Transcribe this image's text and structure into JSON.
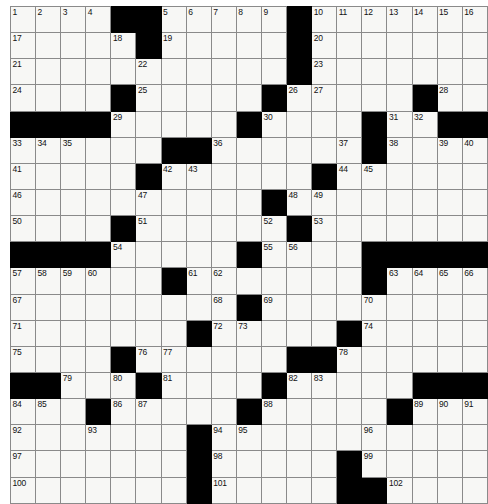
{
  "puzzle": {
    "title": "Crossword Grid",
    "type": "crossword",
    "rows": 19,
    "cols": 19,
    "cell_fill_color": "#f7f7f5",
    "block_color": "#000000",
    "grid_line_color": "#8a8a8a",
    "max_clue_number": 102,
    "grid": [
      [
        {
          "n": "1"
        },
        {
          "n": "2"
        },
        {
          "n": "3"
        },
        {
          "n": "4"
        },
        {
          "b": 1
        },
        {
          "b": 1
        },
        {
          "n": "5"
        },
        {
          "n": "6"
        },
        {
          "n": "7"
        },
        {
          "n": "8"
        },
        {
          "n": "9"
        },
        {
          "b": 1
        },
        {
          "n": "10"
        },
        {
          "n": "11"
        },
        {
          "n": "12"
        },
        {
          "n": "13"
        },
        {
          "n": "14"
        },
        {
          "n": "15"
        },
        {
          "n": "16"
        }
      ],
      [
        {
          "n": "17"
        },
        {},
        {},
        {},
        {
          "n": "18"
        },
        {
          "b": 1
        },
        {
          "n": "19"
        },
        {},
        {},
        {},
        {},
        {
          "b": 1
        },
        {
          "n": "20"
        },
        {},
        {},
        {},
        {},
        {},
        {}
      ],
      [
        {
          "n": "21"
        },
        {},
        {},
        {},
        {},
        {
          "n": "22"
        },
        {},
        {},
        {},
        {},
        {},
        {
          "b": 1
        },
        {
          "n": "23"
        },
        {},
        {},
        {},
        {},
        {},
        {}
      ],
      [
        {
          "n": "24"
        },
        {},
        {},
        {},
        {
          "b": 1
        },
        {
          "n": "25"
        },
        {},
        {},
        {},
        {},
        {
          "b": 1
        },
        {
          "n": "26"
        },
        {
          "n": "27"
        },
        {},
        {},
        {},
        {
          "b": 1
        },
        {
          "n": "28"
        },
        {}
      ],
      [
        {
          "b": 1
        },
        {
          "b": 1
        },
        {
          "b": 1
        },
        {
          "b": 1
        },
        {
          "n": "29"
        },
        {},
        {},
        {},
        {},
        {
          "b": 1
        },
        {
          "n": "30"
        },
        {},
        {},
        {},
        {
          "b": 1
        },
        {
          "n": "31"
        },
        {
          "n": "32"
        },
        {
          "b": 1
        },
        {
          "b": 1
        }
      ],
      [
        {
          "n": "33"
        },
        {
          "n": "34"
        },
        {
          "n": "35"
        },
        {},
        {},
        {},
        {
          "b": 1
        },
        {
          "b": 1
        },
        {
          "n": "36"
        },
        {},
        {},
        {},
        {},
        {
          "n": "37"
        },
        {
          "b": 1
        },
        {
          "n": "38"
        },
        {},
        {
          "n": "39"
        },
        {
          "n": "40"
        }
      ],
      [
        {
          "n": "41"
        },
        {},
        {},
        {},
        {},
        {
          "b": 1
        },
        {
          "n": "42"
        },
        {
          "n": "43"
        },
        {},
        {},
        {},
        {},
        {
          "b": 1
        },
        {
          "n": "44"
        },
        {
          "n": "45"
        },
        {},
        {},
        {},
        {}
      ],
      [
        {
          "n": "46"
        },
        {},
        {},
        {},
        {},
        {
          "n": "47"
        },
        {},
        {},
        {},
        {},
        {
          "b": 1
        },
        {
          "n": "48"
        },
        {
          "n": "49"
        },
        {},
        {},
        {},
        {},
        {},
        {}
      ],
      [
        {
          "n": "50"
        },
        {},
        {},
        {},
        {
          "b": 1
        },
        {
          "n": "51"
        },
        {},
        {},
        {},
        {},
        {
          "n": "52"
        },
        {
          "b": 1
        },
        {
          "n": "53"
        },
        {},
        {},
        {},
        {},
        {},
        {}
      ],
      [
        {
          "b": 1
        },
        {
          "b": 1
        },
        {
          "b": 1
        },
        {
          "b": 1
        },
        {
          "n": "54"
        },
        {},
        {},
        {},
        {},
        {
          "b": 1
        },
        {
          "n": "55"
        },
        {
          "n": "56"
        },
        {},
        {},
        {
          "b": 1
        },
        {
          "b": 1
        },
        {
          "b": 1
        },
        {
          "b": 1
        },
        {
          "b": 1
        }
      ],
      [
        {
          "n": "57"
        },
        {
          "n": "58"
        },
        {
          "n": "59"
        },
        {
          "n": "60"
        },
        {},
        {},
        {
          "b": 1
        },
        {
          "n": "61"
        },
        {
          "n": "62"
        },
        {},
        {},
        {},
        {},
        {},
        {
          "b": 1
        },
        {
          "n": "63"
        },
        {
          "n": "64"
        },
        {
          "n": "65"
        },
        {
          "n": "66"
        }
      ],
      [
        {
          "n": "67"
        },
        {},
        {},
        {},
        {},
        {},
        {},
        {},
        {
          "n": "68"
        },
        {
          "b": 1
        },
        {
          "n": "69"
        },
        {},
        {},
        {},
        {
          "n": "70"
        },
        {},
        {},
        {},
        {}
      ],
      [
        {
          "n": "71"
        },
        {},
        {},
        {},
        {},
        {},
        {},
        {
          "b": 1
        },
        {
          "n": "72"
        },
        {
          "n": "73"
        },
        {},
        {},
        {},
        {
          "b": 1
        },
        {
          "n": "74"
        },
        {},
        {},
        {},
        {}
      ],
      [
        {
          "n": "75"
        },
        {},
        {},
        {},
        {
          "b": 1
        },
        {
          "n": "76"
        },
        {
          "n": "77"
        },
        {},
        {},
        {},
        {},
        {
          "b": 1
        },
        {
          "b": 1
        },
        {
          "n": "78"
        },
        {},
        {},
        {},
        {},
        {}
      ],
      [
        {
          "b": 1
        },
        {
          "b": 1
        },
        {
          "n": "79"
        },
        {},
        {
          "n": "80"
        },
        {
          "b": 1
        },
        {
          "n": "81"
        },
        {},
        {},
        {},
        {
          "b": 1
        },
        {
          "n": "82"
        },
        {
          "n": "83"
        },
        {},
        {},
        {},
        {
          "b": 1
        },
        {
          "b": 1
        },
        {
          "b": 1
        }
      ],
      [
        {
          "n": "84"
        },
        {
          "n": "85"
        },
        {},
        {
          "b": 1
        },
        {
          "n": "86"
        },
        {
          "n": "87"
        },
        {},
        {},
        {},
        {
          "b": 1
        },
        {
          "n": "88"
        },
        {},
        {},
        {},
        {},
        {
          "b": 1
        },
        {
          "n": "89"
        },
        {
          "n": "90"
        },
        {
          "n": "91"
        }
      ],
      [
        {
          "n": "92"
        },
        {},
        {},
        {
          "n": "93"
        },
        {},
        {},
        {},
        {
          "b": 1
        },
        {
          "n": "94"
        },
        {
          "n": "95"
        },
        {},
        {},
        {},
        {},
        {
          "n": "96"
        },
        {},
        {},
        {},
        {}
      ],
      [
        {
          "n": "97"
        },
        {},
        {},
        {},
        {},
        {},
        {},
        {
          "b": 1
        },
        {
          "n": "98"
        },
        {},
        {},
        {},
        {},
        {
          "b": 1
        },
        {
          "n": "99"
        },
        {},
        {},
        {},
        {}
      ],
      [
        {
          "n": "100"
        },
        {},
        {},
        {},
        {},
        {},
        {},
        {
          "b": 1
        },
        {
          "n": "101"
        },
        {},
        {},
        {},
        {},
        {
          "b": 1
        },
        {
          "b": 1
        },
        {
          "n": "102"
        },
        {},
        {},
        {}
      ]
    ]
  }
}
